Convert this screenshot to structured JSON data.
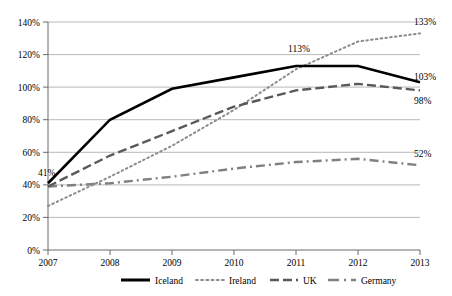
{
  "chart_data": {
    "type": "line",
    "title": "",
    "subtitle": "",
    "xlabel": "",
    "ylabel": "",
    "x": [
      "2007",
      "2008",
      "2009",
      "2010",
      "2011",
      "2012",
      "2013"
    ],
    "categories": [
      "2007",
      "2008",
      "2009",
      "2010",
      "2011",
      "2012",
      "2013"
    ],
    "xticklabels": [
      "2007",
      "2008",
      "2009",
      "2010",
      "2011",
      "2012",
      "2013"
    ],
    "yticklabels": [
      "0%",
      "20%",
      "40%",
      "60%",
      "80%",
      "100%",
      "120%",
      "140%"
    ],
    "ytickvalues": [
      0,
      20,
      40,
      60,
      80,
      100,
      120,
      140
    ],
    "ylim": [
      0,
      140
    ],
    "grid": "horizontal",
    "legend_position": "bottom",
    "series": [
      {
        "name": "Iceland",
        "style": "solid",
        "color": "#000000",
        "width": 2.6,
        "values": [
          41,
          80,
          99,
          106,
          113,
          113,
          103
        ]
      },
      {
        "name": "Ireland",
        "style": "dotted",
        "color": "#8c8c8c",
        "width": 2.0,
        "values": [
          27,
          45,
          64,
          86,
          111,
          128,
          133
        ]
      },
      {
        "name": "UK",
        "style": "dashed",
        "color": "#595959",
        "width": 2.4,
        "values": [
          39,
          58,
          73,
          88,
          98,
          102,
          98
        ]
      },
      {
        "name": "Germany",
        "style": "dashdot",
        "color": "#808080",
        "width": 2.4,
        "values": [
          39,
          41,
          45,
          50,
          54,
          56,
          52
        ]
      }
    ],
    "annotations": [
      {
        "text": "41%",
        "series": "Iceland",
        "x": "2007",
        "value": 41,
        "anchor": "left"
      },
      {
        "text": "113%",
        "series": "Iceland",
        "x": "2011",
        "value": 113,
        "anchor": "above"
      },
      {
        "text": "133%",
        "series": "Ireland",
        "x": "2013",
        "value": 133,
        "anchor": "right"
      },
      {
        "text": "103%",
        "series": "Iceland",
        "x": "2013",
        "value": 103,
        "anchor": "right"
      },
      {
        "text": "98%",
        "series": "UK",
        "x": "2013",
        "value": 98,
        "anchor": "right"
      },
      {
        "text": "52%",
        "series": "Germany",
        "x": "2013",
        "value": 52,
        "anchor": "right"
      }
    ]
  },
  "legend": {
    "items": [
      {
        "label": "Iceland"
      },
      {
        "label": "Ireland"
      },
      {
        "label": "UK"
      },
      {
        "label": "Germany"
      }
    ]
  },
  "axes": {
    "y": {
      "labels": [
        "140%",
        "120%",
        "100%",
        "80%",
        "60%",
        "40%",
        "20%",
        "0%"
      ]
    },
    "x": {
      "labels": [
        "2007",
        "2008",
        "2009",
        "2010",
        "2011",
        "2012",
        "2013"
      ]
    }
  }
}
